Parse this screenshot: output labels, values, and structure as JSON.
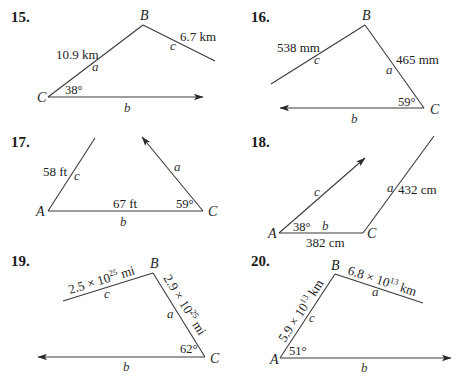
{
  "problems": [
    {
      "number": "15.",
      "vertices": {
        "B": "B",
        "C": "C"
      },
      "sides": {
        "a": "a",
        "b": "b",
        "c": "c"
      },
      "given": {
        "a_length": "10.9 km",
        "c_length": "6.7 km",
        "angle_C": "38°"
      }
    },
    {
      "number": "16.",
      "vertices": {
        "B": "B",
        "C": "C"
      },
      "sides": {
        "a": "a",
        "b": "b",
        "c": "c"
      },
      "given": {
        "c_length": "538 mm",
        "a_length": "465 mm",
        "angle_C": "59°"
      }
    },
    {
      "number": "17.",
      "vertices": {
        "A": "A",
        "C": "C"
      },
      "sides": {
        "a": "a",
        "b": "b",
        "c": "c"
      },
      "given": {
        "c_length": "58 ft",
        "b_length": "67 ft",
        "angle_C": "59°"
      }
    },
    {
      "number": "18.",
      "vertices": {
        "A": "A",
        "C": "C"
      },
      "sides": {
        "a": "a",
        "b": "b",
        "c": "c"
      },
      "given": {
        "a_length": "432 cm",
        "b_length": "382 cm",
        "angle_A": "38°"
      }
    },
    {
      "number": "19.",
      "vertices": {
        "B": "B",
        "C": "C"
      },
      "sides": {
        "a": "a",
        "b": "b",
        "c": "c"
      },
      "given": {
        "c_mantissa": "2.5 × 10",
        "c_exp": "25",
        "c_unit": " mi",
        "a_mantissa": "2.9 × 10",
        "a_exp": "25",
        "a_unit": " mi",
        "angle_C": "62°"
      }
    },
    {
      "number": "20.",
      "vertices": {
        "A": "A",
        "B": "B"
      },
      "sides": {
        "a": "a",
        "b": "b",
        "c": "c"
      },
      "given": {
        "a_mantissa": "6.8 × 10",
        "a_exp": "13",
        "a_unit": " km",
        "c_mantissa": "5.9 × 10",
        "c_exp": "13",
        "c_unit": " km",
        "angle_A": "51°"
      }
    }
  ]
}
